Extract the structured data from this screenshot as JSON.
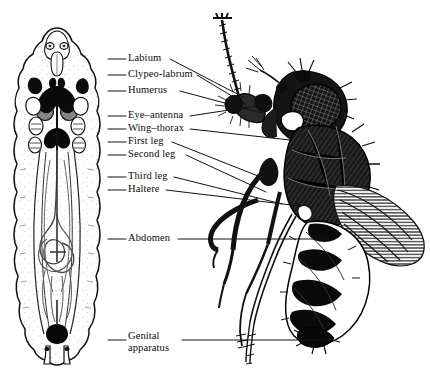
{
  "figure": {
    "background_color": "#ffffff",
    "ink_color": "#000000",
    "width": 430,
    "height": 381
  },
  "labels": [
    {
      "id": "labium",
      "text": "Labium",
      "x": 128,
      "y": 52,
      "left_leader": {
        "x1": 108,
        "y1": 59,
        "x2": 126,
        "y2": 59
      },
      "right_leader": {
        "x1": 170,
        "y1": 59,
        "x2": 243,
        "y2": 97
      }
    },
    {
      "id": "clypeo-labrum",
      "text": "Clypeo-labrum",
      "x": 128,
      "y": 68,
      "left_leader": {
        "x1": 108,
        "y1": 75,
        "x2": 126,
        "y2": 75
      },
      "right_leader": {
        "x1": 197,
        "y1": 75,
        "x2": 245,
        "y2": 104
      }
    },
    {
      "id": "humerus",
      "text": "Humerus",
      "x": 128,
      "y": 84,
      "left_leader": {
        "x1": 108,
        "y1": 91,
        "x2": 126,
        "y2": 91
      },
      "right_leader": {
        "x1": 180,
        "y1": 91,
        "x2": 262,
        "y2": 113
      }
    },
    {
      "id": "eye-antenna",
      "text": "Eye–antenna",
      "x": 128,
      "y": 109,
      "left_leader": {
        "x1": 108,
        "y1": 116,
        "x2": 126,
        "y2": 116
      },
      "right_leader": {
        "x1": 190,
        "y1": 116,
        "x2": 268,
        "y2": 104
      }
    },
    {
      "id": "wing-thorax",
      "text": "Wing–thorax",
      "x": 128,
      "y": 122,
      "left_leader": {
        "x1": 108,
        "y1": 129,
        "x2": 126,
        "y2": 129
      },
      "right_leader": {
        "x1": 190,
        "y1": 129,
        "x2": 290,
        "y2": 140
      }
    },
    {
      "id": "first-leg",
      "text": "First leg",
      "x": 128,
      "y": 135,
      "left_leader": {
        "x1": 108,
        "y1": 142,
        "x2": 126,
        "y2": 142
      },
      "right_leader": {
        "x1": 172,
        "y1": 142,
        "x2": 258,
        "y2": 176
      }
    },
    {
      "id": "second-leg",
      "text": "Second leg",
      "x": 128,
      "y": 148,
      "left_leader": {
        "x1": 108,
        "y1": 155,
        "x2": 126,
        "y2": 155
      },
      "right_leader": {
        "x1": 186,
        "y1": 155,
        "x2": 266,
        "y2": 192
      }
    },
    {
      "id": "third-leg",
      "text": "Third leg",
      "x": 128,
      "y": 170,
      "left_leader": {
        "x1": 108,
        "y1": 177,
        "x2": 126,
        "y2": 177
      },
      "right_leader": {
        "x1": 174,
        "y1": 177,
        "x2": 282,
        "y2": 204
      }
    },
    {
      "id": "haltere",
      "text": "Haltere",
      "x": 128,
      "y": 183,
      "left_leader": {
        "x1": 108,
        "y1": 190,
        "x2": 126,
        "y2": 190
      },
      "right_leader": {
        "x1": 166,
        "y1": 190,
        "x2": 300,
        "y2": 206
      }
    },
    {
      "id": "abdomen",
      "text": "Abdomen",
      "x": 128,
      "y": 232,
      "left_leader": {
        "x1": 108,
        "y1": 239,
        "x2": 126,
        "y2": 239
      },
      "right_leader": {
        "x1": 178,
        "y1": 239,
        "x2": 330,
        "y2": 239
      }
    },
    {
      "id": "genital-apparatus",
      "text": "Genital\napparatus",
      "x": 128,
      "y": 330,
      "left_leader": {
        "x1": 108,
        "y1": 340,
        "x2": 126,
        "y2": 340
      },
      "right_leader": {
        "x1": 182,
        "y1": 340,
        "x2": 330,
        "y2": 340
      }
    }
  ],
  "specimens": {
    "larva": {
      "name": "larva",
      "description": "Third-instar larva, dorsal view, showing paired imaginal discs and gonads",
      "side": "left"
    },
    "adult": {
      "name": "adult fly",
      "description": "Adult Drosophila, lateral view, with compound eye, wing, legs and banded abdomen",
      "side": "right"
    }
  }
}
